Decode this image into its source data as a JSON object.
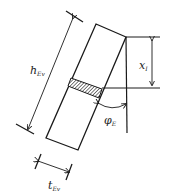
{
  "diagram": {
    "type": "wall-segment rotation sketch",
    "labels": {
      "height": {
        "main": "h",
        "sub": "Ev"
      },
      "thickness": {
        "main": "t",
        "sub": "Ev"
      },
      "depth": {
        "main": "x",
        "sub": "I"
      },
      "angle": {
        "main": "φ",
        "sub": "E"
      }
    },
    "colors": {
      "stroke": "#1a1a1a",
      "hatch": "#333333",
      "background": "#ffffff"
    }
  }
}
